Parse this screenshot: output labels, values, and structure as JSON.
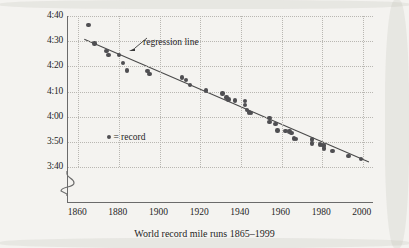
{
  "chart_data": {
    "type": "scatter",
    "title": "",
    "xlabel": "World record mile runs 1865–1999",
    "ylabel": "Time (minutes : seconds)",
    "xlim": [
      1855,
      2005
    ],
    "ylim_seconds": [
      218,
      282
    ],
    "xticks": [
      1860,
      1880,
      1900,
      1920,
      1940,
      1960,
      1980,
      2000
    ],
    "xtick_labels": [
      "1860",
      "1880",
      "1900",
      "1920",
      "1940",
      "1960",
      "1980",
      "2000"
    ],
    "yticks_seconds": [
      280,
      270,
      260,
      250,
      240,
      230,
      220
    ],
    "ytick_labels": [
      "4:40",
      "4:30",
      "4:20",
      "4:10",
      "4:00",
      "3:50",
      "3:40"
    ],
    "grid": true,
    "axis_break": "y-axis broken below 3:40",
    "legend": {
      "position": "inside-left",
      "marker": "●",
      "text": "= record"
    },
    "annotations": [
      {
        "text": "regression line",
        "points_to": "trend-line"
      }
    ],
    "series": [
      {
        "name": "record",
        "marker": "filled-circle",
        "color": "#4f4f52",
        "points": [
          {
            "x": 1865,
            "y_label": "4:36.5",
            "y_seconds": 276.5
          },
          {
            "x": 1868,
            "y_label": "4:29.0",
            "y_seconds": 269.0
          },
          {
            "x": 1874,
            "y_label": "4:26.0",
            "y_seconds": 266.0
          },
          {
            "x": 1875,
            "y_label": "4:24.5",
            "y_seconds": 264.5
          },
          {
            "x": 1880,
            "y_label": "4:24.5",
            "y_seconds": 264.5
          },
          {
            "x": 1882,
            "y_label": "4:21.4",
            "y_seconds": 261.4
          },
          {
            "x": 1884,
            "y_label": "4:18.4",
            "y_seconds": 258.4
          },
          {
            "x": 1894,
            "y_label": "4:18.2",
            "y_seconds": 258.2
          },
          {
            "x": 1895,
            "y_label": "4:17.0",
            "y_seconds": 257.0
          },
          {
            "x": 1911,
            "y_label": "4:15.6",
            "y_seconds": 255.6
          },
          {
            "x": 1913,
            "y_label": "4:14.6",
            "y_seconds": 254.6
          },
          {
            "x": 1915,
            "y_label": "4:12.6",
            "y_seconds": 252.6
          },
          {
            "x": 1923,
            "y_label": "4:10.4",
            "y_seconds": 250.4
          },
          {
            "x": 1931,
            "y_label": "4:09.2",
            "y_seconds": 249.2
          },
          {
            "x": 1933,
            "y_label": "4:07.6",
            "y_seconds": 247.6
          },
          {
            "x": 1934,
            "y_label": "4:06.8",
            "y_seconds": 246.8
          },
          {
            "x": 1937,
            "y_label": "4:06.4",
            "y_seconds": 246.4
          },
          {
            "x": 1942,
            "y_label": "4:06.2",
            "y_seconds": 246.2
          },
          {
            "x": 1942,
            "y_label": "4:04.6",
            "y_seconds": 244.6
          },
          {
            "x": 1943,
            "y_label": "4:02.6",
            "y_seconds": 242.6
          },
          {
            "x": 1944,
            "y_label": "4:01.6",
            "y_seconds": 241.6
          },
          {
            "x": 1945,
            "y_label": "4:01.4",
            "y_seconds": 241.4
          },
          {
            "x": 1954,
            "y_label": "3:59.4",
            "y_seconds": 239.4
          },
          {
            "x": 1954,
            "y_label": "3:58.0",
            "y_seconds": 238.0
          },
          {
            "x": 1957,
            "y_label": "3:57.2",
            "y_seconds": 237.2
          },
          {
            "x": 1958,
            "y_label": "3:54.5",
            "y_seconds": 234.5
          },
          {
            "x": 1962,
            "y_label": "3:54.4",
            "y_seconds": 234.4
          },
          {
            "x": 1964,
            "y_label": "3:54.1",
            "y_seconds": 234.1
          },
          {
            "x": 1965,
            "y_label": "3:53.6",
            "y_seconds": 233.6
          },
          {
            "x": 1966,
            "y_label": "3:51.3",
            "y_seconds": 231.3
          },
          {
            "x": 1967,
            "y_label": "3:51.1",
            "y_seconds": 231.1
          },
          {
            "x": 1975,
            "y_label": "3:51.0",
            "y_seconds": 231.0
          },
          {
            "x": 1975,
            "y_label": "3:49.4",
            "y_seconds": 229.4
          },
          {
            "x": 1979,
            "y_label": "3:49.0",
            "y_seconds": 229.0
          },
          {
            "x": 1980,
            "y_label": "3:48.8",
            "y_seconds": 228.8
          },
          {
            "x": 1981,
            "y_label": "3:48.5",
            "y_seconds": 228.5
          },
          {
            "x": 1981,
            "y_label": "3:47.3",
            "y_seconds": 227.3
          },
          {
            "x": 1985,
            "y_label": "3:46.3",
            "y_seconds": 226.3
          },
          {
            "x": 1993,
            "y_label": "3:44.4",
            "y_seconds": 224.4
          },
          {
            "x": 1999,
            "y_label": "3:43.1",
            "y_seconds": 223.1
          }
        ]
      }
    ],
    "trend_line": {
      "name": "regression line",
      "color": "#4a4a4a",
      "x_start": 1863,
      "x_end": 2003,
      "y_start_seconds": 270.8,
      "y_end_seconds": 222.0
    }
  }
}
